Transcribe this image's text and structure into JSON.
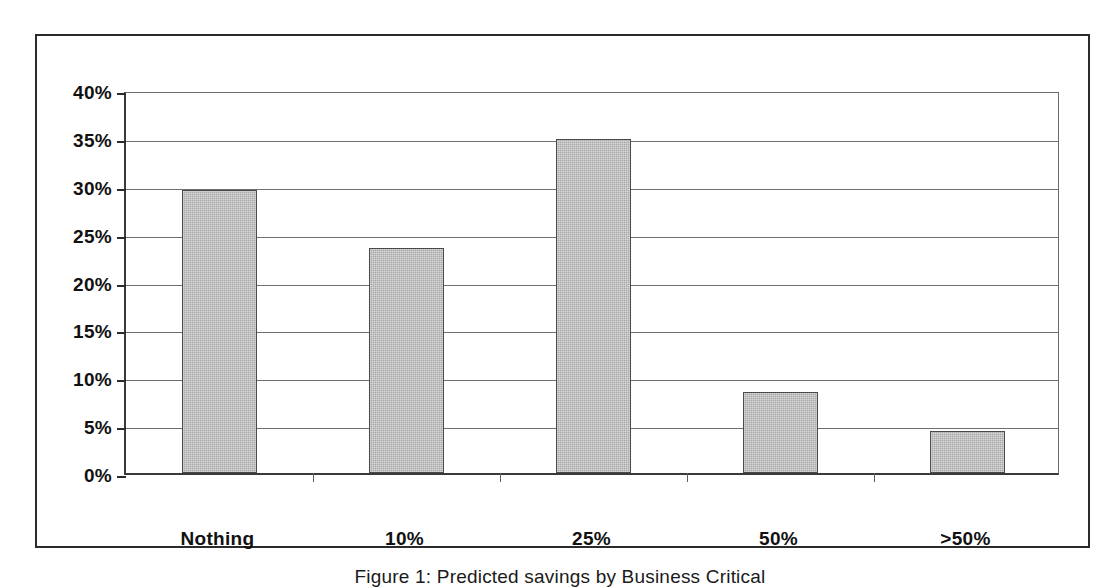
{
  "figure": {
    "caption": "Figure 1: Predicted savings by Business Critical"
  },
  "chart_data": {
    "type": "bar",
    "title": "",
    "xlabel": "",
    "ylabel": "",
    "categories": [
      "Nothing",
      "10%",
      "25%",
      "50%",
      ">50%"
    ],
    "values": [
      29.6,
      23.5,
      34.9,
      8.5,
      4.4
    ],
    "value_unit": "%",
    "ylim": [
      0,
      40
    ],
    "ytick_values": [
      0,
      5,
      10,
      15,
      20,
      25,
      30,
      35,
      40
    ],
    "ytick_labels": [
      "0%",
      "5%",
      "10%",
      "15%",
      "20%",
      "25%",
      "30%",
      "35%",
      "40%"
    ],
    "grid": true,
    "grid_axis": "y",
    "legend": false,
    "legend_position": "none",
    "series": [
      {
        "name": "Respondents",
        "values": [
          29.6,
          23.5,
          34.9,
          8.5,
          4.4
        ]
      }
    ],
    "colors": {
      "bar_fill": "#a9a9a9",
      "bar_border": "#4a4a4a",
      "gridline": "#6f6f6f",
      "axis": "#2b2b2b",
      "frame": "#2b2b2b",
      "background": "#ffffff",
      "text": "#111111"
    }
  }
}
